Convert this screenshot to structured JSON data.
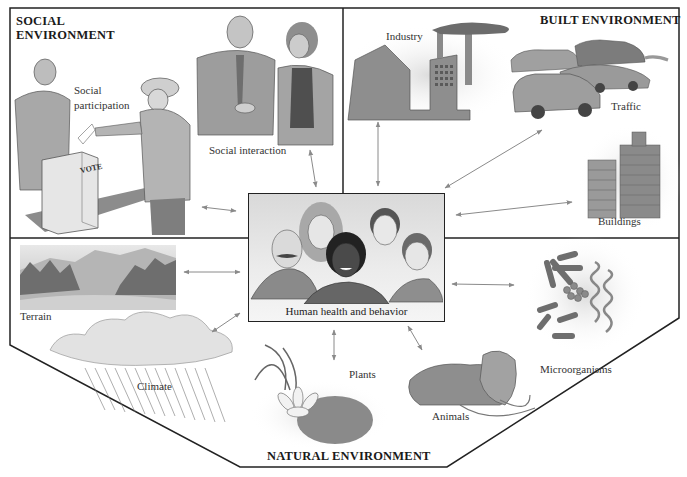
{
  "diagram": {
    "type": "conceptual-relationship-diagram",
    "center": {
      "label": "Human health and behavior"
    },
    "sections": {
      "social": {
        "title_line1": "SOCIAL",
        "title_line2": "ENVIRONMENT",
        "items": [
          {
            "label_line1": "Social",
            "label_line2": "participation"
          },
          {
            "label": "Social interaction"
          }
        ],
        "ballot_box_text": "VOTE"
      },
      "built": {
        "title": "BUILT ENVIRONMENT",
        "items": [
          {
            "label": "Industry"
          },
          {
            "label": "Traffic"
          },
          {
            "label": "Buildings"
          }
        ]
      },
      "natural": {
        "title": "NATURAL ENVIRONMENT",
        "items": [
          {
            "label": "Terrain"
          },
          {
            "label": "Climate"
          },
          {
            "label": "Plants"
          },
          {
            "label": "Animals"
          },
          {
            "label": "Microorganisms"
          }
        ]
      }
    },
    "connections": [
      {
        "from": "Social participation",
        "to": "Human health and behavior",
        "type": "bidirectional"
      },
      {
        "from": "Social interaction",
        "to": "Human health and behavior",
        "type": "bidirectional"
      },
      {
        "from": "Industry",
        "to": "Human health and behavior",
        "type": "bidirectional"
      },
      {
        "from": "Traffic",
        "to": "Human health and behavior",
        "type": "bidirectional"
      },
      {
        "from": "Buildings",
        "to": "Human health and behavior",
        "type": "bidirectional"
      },
      {
        "from": "Terrain",
        "to": "Human health and behavior",
        "type": "bidirectional"
      },
      {
        "from": "Climate",
        "to": "Human health and behavior",
        "type": "bidirectional"
      },
      {
        "from": "Plants",
        "to": "Human health and behavior",
        "type": "bidirectional"
      },
      {
        "from": "Animals",
        "to": "Human health and behavior",
        "type": "bidirectional"
      },
      {
        "from": "Microorganisms",
        "to": "Human health and behavior",
        "type": "bidirectional"
      }
    ],
    "colors": {
      "frame": "#222222",
      "arrow": "#8a8a8a",
      "illustration_fill": "#9a9a9a",
      "illustration_light": "#d8d8d8",
      "background": "#ffffff"
    }
  }
}
